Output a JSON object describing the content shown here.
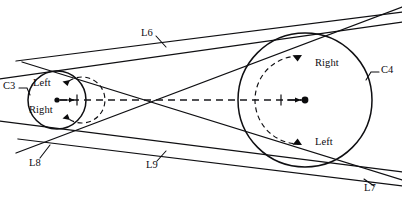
{
  "figure": {
    "type": "geometric-diagram",
    "title": "",
    "background_color": "#ffffff",
    "stroke_color": "#0f0f12",
    "width": 402,
    "height": 209
  },
  "circles": [
    {
      "id": "C3",
      "label": "C3",
      "center": {
        "x": 57,
        "y": 100
      },
      "radius": 29,
      "label_position": {
        "x": 3,
        "y": 85
      },
      "directions": [
        {
          "label": "Left",
          "position": "upper",
          "arrow": "counterclockwise"
        },
        {
          "label": "Right",
          "position": "lower",
          "arrow": "counterclockwise"
        }
      ]
    },
    {
      "id": "C4",
      "label": "C4",
      "center": {
        "x": 305,
        "y": 100
      },
      "radius": 67,
      "label_position": {
        "x": 381,
        "y": 69
      },
      "directions": [
        {
          "label": "Right",
          "position": "upper",
          "arrow": "clockwise"
        },
        {
          "label": "Left",
          "position": "lower",
          "arrow": "clockwise"
        }
      ]
    }
  ],
  "tangent_lines": [
    {
      "id": "L6",
      "label": "L6",
      "kind": "external-upper",
      "label_position": {
        "x": 141,
        "y": 33
      }
    },
    {
      "id": "L7",
      "label": "L7",
      "kind": "external-lower",
      "label_position": {
        "x": 365,
        "y": 189
      }
    },
    {
      "id": "L8",
      "label": "L8",
      "kind": "internal-crossing",
      "label_position": {
        "x": 31,
        "y": 163
      }
    },
    {
      "id": "L9",
      "label": "L9",
      "kind": "internal-crossing",
      "label_position": {
        "x": 147,
        "y": 166
      }
    }
  ],
  "center_axis": {
    "style": "dashed",
    "from": {
      "x": 57,
      "y": 100
    },
    "to": {
      "x": 305,
      "y": 100
    },
    "crossing_point": {
      "x": 146,
      "y": 100
    }
  },
  "labels": {
    "left_direction": "Left",
    "right_direction": "Right"
  }
}
